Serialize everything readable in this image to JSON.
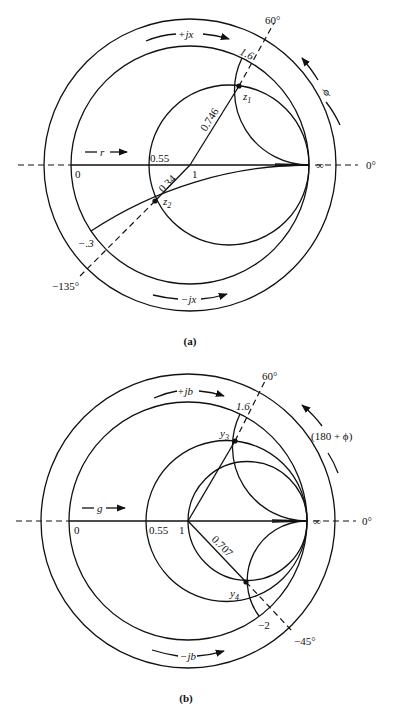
{
  "figure_a": {
    "caption": "(a)",
    "labels": {
      "plus_jx": "+jx",
      "minus_jx": "−jx",
      "r_arrow": "r",
      "zero": "0",
      "r055": "0.55",
      "one": "1",
      "infinity": "∞",
      "zero_deg": "0°",
      "sixty_deg": "60°",
      "minus135_deg": "−135°",
      "phi": "ϕ",
      "x16": "1.6",
      "xm03": "−.3",
      "d0746": "0.746",
      "d034": "0.34",
      "z1": "z",
      "z1_sub": "1",
      "z2": "z",
      "z2_sub": "2"
    },
    "points": {
      "z1": {
        "magnitude": 0.746,
        "angle_deg": 60,
        "reactance": 1.6
      },
      "z2": {
        "magnitude": 0.34,
        "angle_deg": -135,
        "reactance": -0.3
      },
      "resistance_circle": 0.55
    }
  },
  "figure_b": {
    "caption": "(b)",
    "labels": {
      "plus_jb": "+jb",
      "minus_jb": "−jb",
      "g_arrow": "g",
      "zero": "0",
      "g055": "0.55",
      "one": "1",
      "infinity": "∞",
      "zero_deg": "0°",
      "sixty_deg": "60°",
      "minus45_deg": "−45°",
      "phi": "(180 + ϕ)",
      "b16": "1.6",
      "bm2": "−2",
      "d0707": "0.707",
      "y3": "y",
      "y3_sub": "3",
      "y4": "y",
      "y4_sub": "4"
    },
    "points": {
      "y3": {
        "angle_deg": 60,
        "susceptance": 1.6
      },
      "y4": {
        "magnitude": 0.707,
        "angle_deg": -45,
        "susceptance": -2
      },
      "conductance_circle": 0.55
    }
  }
}
